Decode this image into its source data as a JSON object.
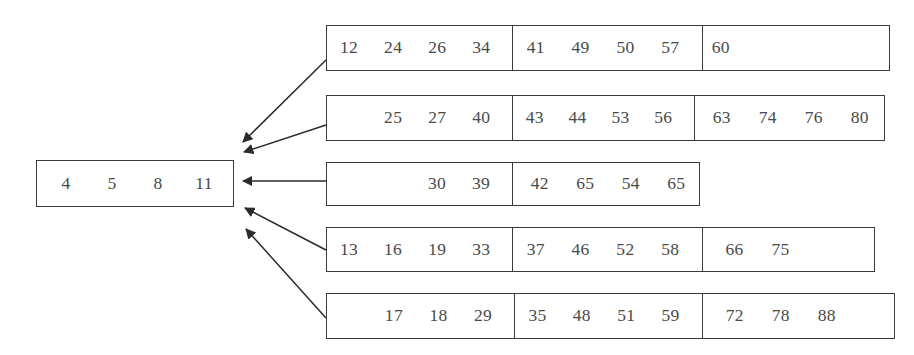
{
  "diagram": {
    "type": "multiway-merge",
    "result": {
      "label": "output-buffer",
      "values": [
        "4",
        "5",
        "8",
        "11"
      ]
    },
    "runs": [
      {
        "label": "run-1",
        "segments": [
          {
            "leading_blanks": 0,
            "values": [
              "12",
              "24",
              "26",
              "34"
            ]
          },
          {
            "leading_blanks": 0,
            "values": [
              "41",
              "49",
              "50",
              "57"
            ]
          },
          {
            "leading_blanks": 0,
            "values": [
              "60"
            ]
          }
        ]
      },
      {
        "label": "run-2",
        "segments": [
          {
            "leading_blanks": 1,
            "values": [
              "25",
              "27",
              "40"
            ]
          },
          {
            "leading_blanks": 0,
            "values": [
              "43",
              "44",
              "53",
              "56"
            ]
          },
          {
            "leading_blanks": 0,
            "values": [
              "63",
              "74",
              "76",
              "80"
            ]
          }
        ]
      },
      {
        "label": "run-3",
        "segments": [
          {
            "leading_blanks": 2,
            "values": [
              "30",
              "39"
            ]
          },
          {
            "leading_blanks": 0,
            "values": [
              "42",
              "65",
              "54",
              "65"
            ]
          }
        ]
      },
      {
        "label": "run-4",
        "segments": [
          {
            "leading_blanks": 0,
            "values": [
              "13",
              "16",
              "19",
              "33"
            ]
          },
          {
            "leading_blanks": 0,
            "values": [
              "37",
              "46",
              "52",
              "58"
            ]
          },
          {
            "leading_blanks": 0,
            "values": [
              "66",
              "75"
            ]
          }
        ]
      },
      {
        "label": "run-5",
        "segments": [
          {
            "leading_blanks": 1,
            "values": [
              "17",
              "18",
              "29"
            ]
          },
          {
            "leading_blanks": 0,
            "values": [
              "35",
              "48",
              "51",
              "59"
            ]
          },
          {
            "leading_blanks": 0,
            "values": [
              "72",
              "78",
              "88"
            ]
          }
        ]
      }
    ],
    "arrows": {
      "label": "merge-arrows",
      "count": 5,
      "direction": "right-to-left",
      "color": "#2b2b2b"
    },
    "colors": {
      "border": "#3a3a3a",
      "text": "#4a4a4a",
      "background": "#ffffff",
      "arrow": "#2b2b2b"
    }
  },
  "geometry": {
    "result_box": {
      "x": 36,
      "y": 160,
      "w": 198,
      "h": 47
    },
    "runs": [
      {
        "x": 326,
        "y": 25,
        "w": 564,
        "h": 46,
        "dividers": [
          187,
          377
        ]
      },
      {
        "x": 326,
        "y": 95,
        "w": 559,
        "h": 46,
        "dividers": [
          187,
          369
        ]
      },
      {
        "x": 326,
        "y": 162,
        "w": 374,
        "h": 44,
        "dividers": [
          187
        ]
      },
      {
        "x": 326,
        "y": 227,
        "w": 549,
        "h": 45,
        "dividers": [
          187,
          377
        ]
      },
      {
        "x": 326,
        "y": 293,
        "w": 569,
        "h": 46,
        "dividers": [
          189,
          377
        ]
      }
    ],
    "arrow_targets": [
      {
        "x": 238,
        "y": 143
      },
      {
        "x": 239,
        "y": 152
      },
      {
        "x": 238,
        "y": 181
      },
      {
        "x": 240,
        "y": 209
      },
      {
        "x": 241,
        "y": 230
      }
    ],
    "arrow_sources": [
      {
        "x": 326,
        "y": 60
      },
      {
        "x": 326,
        "y": 125
      },
      {
        "x": 326,
        "y": 181
      },
      {
        "x": 326,
        "y": 250
      },
      {
        "x": 326,
        "y": 318
      }
    ]
  }
}
